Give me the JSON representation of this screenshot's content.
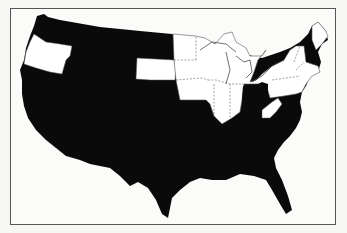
{
  "map": {
    "subject": "United States (contiguous) state map",
    "legend": [],
    "colors": {
      "shaded": "#0a0a0a",
      "unshaded": "#ffffff",
      "border": "#555555",
      "background": "#fbfbf9"
    },
    "shaded_regions": [
      "Washington",
      "California",
      "Nevada",
      "Idaho",
      "Montana",
      "Wyoming",
      "Utah",
      "Arizona",
      "Colorado",
      "New Mexico",
      "North Dakota",
      "Nebraska",
      "Kansas",
      "Oklahoma",
      "Texas",
      "Missouri",
      "Arkansas",
      "Louisiana",
      "Kentucky",
      "Tennessee",
      "Mississippi",
      "Alabama",
      "Georgia",
      "Florida",
      "South Carolina",
      "North Carolina",
      "Virginia",
      "Maryland",
      "Delaware",
      "Ohio",
      "New Hampshire"
    ],
    "unshaded_regions": [
      "Oregon",
      "South Dakota",
      "Minnesota",
      "Iowa",
      "Wisconsin",
      "Illinois",
      "Indiana",
      "Michigan",
      "West Virginia",
      "Pennsylvania",
      "New York",
      "New Jersey",
      "Vermont",
      "Maine",
      "Massachusetts",
      "Connecticut",
      "Rhode Island"
    ]
  }
}
